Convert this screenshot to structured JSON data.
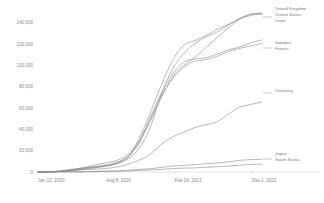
{
  "chart_data": {
    "type": "line",
    "title": "",
    "subtitle": "",
    "xlabel": "",
    "ylabel": "",
    "grid": false,
    "legend_position": "right-at-line-end",
    "xlim": [
      "Jan 22, 2020",
      "Dec 1, 2021"
    ],
    "ylim": [
      0,
      150000
    ],
    "x_tick_labels": [
      "Jan 22, 2020",
      "Aug 8, 2020",
      "Feb 24, 2021",
      "Dec 1, 2021"
    ],
    "x_tick_positions": [
      0,
      0.305,
      0.61,
      0.955
    ],
    "y_tick_labels": [
      "0",
      "20,000",
      "40,000",
      "60,000",
      "80,000",
      "100,000",
      "120,000",
      "140,000"
    ],
    "y_tick_values": [
      0,
      20000,
      40000,
      60000,
      80000,
      100000,
      120000,
      140000
    ],
    "x": [
      0,
      0.05,
      0.1,
      0.15,
      0.2,
      0.25,
      0.3,
      0.35,
      0.4,
      0.45,
      0.5,
      0.55,
      0.6,
      0.65,
      0.7,
      0.75,
      0.8,
      0.85,
      0.9,
      0.95,
      1.0
    ],
    "series": [
      {
        "name": "United Kingdom",
        "color": "#8c8c8c",
        "values": [
          0,
          200,
          900,
          2000,
          3200,
          4600,
          6000,
          8000,
          12000,
          22000,
          42000,
          72000,
          96000,
          112000,
          120000,
          126000,
          132000,
          138000,
          143000,
          147000,
          150000
        ]
      },
      {
        "name": "United States",
        "color": "#8c8c8c",
        "values": [
          0,
          150,
          800,
          2200,
          4000,
          6200,
          8500,
          11000,
          16000,
          28000,
          48000,
          70000,
          88000,
          100000,
          108000,
          116000,
          126000,
          136000,
          143000,
          147500,
          149000
        ]
      },
      {
        "name": "Israel",
        "color": "#8c8c8c",
        "values": [
          0,
          100,
          500,
          1400,
          2600,
          3800,
          5200,
          7500,
          14000,
          30000,
          55000,
          82000,
          104000,
          118000,
          124000,
          128000,
          133000,
          139000,
          144000,
          147000,
          148000
        ]
      },
      {
        "name": "Sweden",
        "color": "#8c8c8c",
        "values": [
          0,
          180,
          1000,
          2400,
          3800,
          5000,
          6400,
          9000,
          15000,
          28000,
          50000,
          74000,
          92000,
          102000,
          106000,
          108000,
          110000,
          114000,
          118000,
          121000,
          123000
        ]
      },
      {
        "name": "France",
        "color": "#8c8c8c",
        "values": [
          0,
          120,
          700,
          1800,
          3000,
          4200,
          5600,
          8200,
          14500,
          27000,
          48000,
          70000,
          88000,
          98000,
          103000,
          106000,
          109000,
          112000,
          116000,
          119000,
          120000
        ]
      },
      {
        "name": "Germany",
        "color": "#8c8c8c",
        "values": [
          0,
          80,
          400,
          1100,
          1900,
          2600,
          3400,
          4600,
          7000,
          11000,
          17000,
          25000,
          33000,
          38000,
          41000,
          44000,
          48000,
          54000,
          60000,
          64000,
          66000
        ]
      },
      {
        "name": "Japan",
        "color": "#8c8c8c",
        "values": [
          0,
          20,
          60,
          150,
          300,
          500,
          750,
          1100,
          1600,
          2300,
          3200,
          4300,
          5400,
          6300,
          7000,
          7600,
          8400,
          9600,
          10800,
          11600,
          12000
        ]
      },
      {
        "name": "South Korea",
        "color": "#8c8c8c",
        "values": [
          0,
          15,
          45,
          110,
          210,
          340,
          500,
          720,
          1000,
          1400,
          1900,
          2500,
          3100,
          3600,
          4000,
          4400,
          4900,
          5600,
          6400,
          7000,
          7400
        ]
      }
    ],
    "legend_groups": [
      {
        "labels": [
          "United Kingdom",
          "United States",
          "Israel"
        ],
        "anchor_y": 10
      },
      {
        "labels": [
          "Sweden",
          "France"
        ],
        "anchor_y": 44
      },
      {
        "labels": [
          "Germany"
        ],
        "anchor_y": 92
      },
      {
        "labels": [
          "Japan",
          "South Korea"
        ],
        "anchor_y": 155
      }
    ]
  },
  "axis": {
    "y_labels": [
      "140,000",
      "120,000",
      "100,000",
      "80,000",
      "60,000",
      "40,000",
      "20,000",
      "0"
    ],
    "x_labels": [
      "Jan 22, 2020",
      "Aug 8, 2020",
      "Feb 24, 2021",
      "Dec 1, 2021"
    ]
  },
  "legend": {
    "group1": [
      "United Kingdom",
      "United States",
      "Israel"
    ],
    "group2": [
      "Sweden",
      "France"
    ],
    "group3": [
      "Germany"
    ],
    "group4": [
      "Japan",
      "South Korea"
    ]
  },
  "colors": {
    "line": "#8c8c8c",
    "axis": "#c9c9c9",
    "text": "#8a8a8a",
    "background": "#ffffff"
  }
}
